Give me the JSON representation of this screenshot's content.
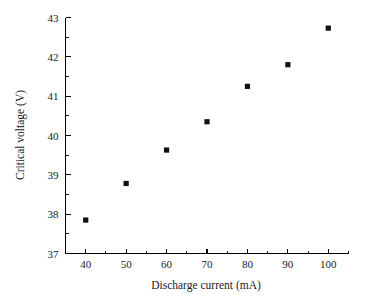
{
  "chart_data": {
    "type": "scatter",
    "title": "",
    "xlabel": "Discharge current (mA)",
    "ylabel": "Critical voltage (V)",
    "xlim": [
      35,
      105
    ],
    "ylim": [
      37,
      43
    ],
    "xticks": [
      40,
      50,
      60,
      70,
      80,
      90,
      100
    ],
    "xtick_labels": [
      "40",
      "50",
      "60",
      "70",
      "80",
      "90",
      "100"
    ],
    "yticks": [
      37,
      38,
      39,
      40,
      41,
      42,
      43
    ],
    "ytick_labels": [
      "37",
      "38",
      "39",
      "40",
      "41",
      "42",
      "43"
    ],
    "x_minor_step": 5,
    "y_minor_step": 0.5,
    "grid": false,
    "legend": null,
    "marker_style": "filled-square",
    "marker_color": "#111111",
    "x": [
      40,
      50,
      60,
      70,
      80,
      90,
      100
    ],
    "values": [
      37.85,
      38.78,
      39.63,
      40.35,
      41.25,
      41.8,
      42.73
    ],
    "points": [
      {
        "x": 40,
        "y": 37.85
      },
      {
        "x": 50,
        "y": 38.78
      },
      {
        "x": 60,
        "y": 39.63
      },
      {
        "x": 70,
        "y": 40.35
      },
      {
        "x": 80,
        "y": 41.25
      },
      {
        "x": 90,
        "y": 41.8
      },
      {
        "x": 100,
        "y": 42.73
      }
    ]
  },
  "figure": {
    "background_color": "#ffffff",
    "axis_color": "#000000"
  }
}
